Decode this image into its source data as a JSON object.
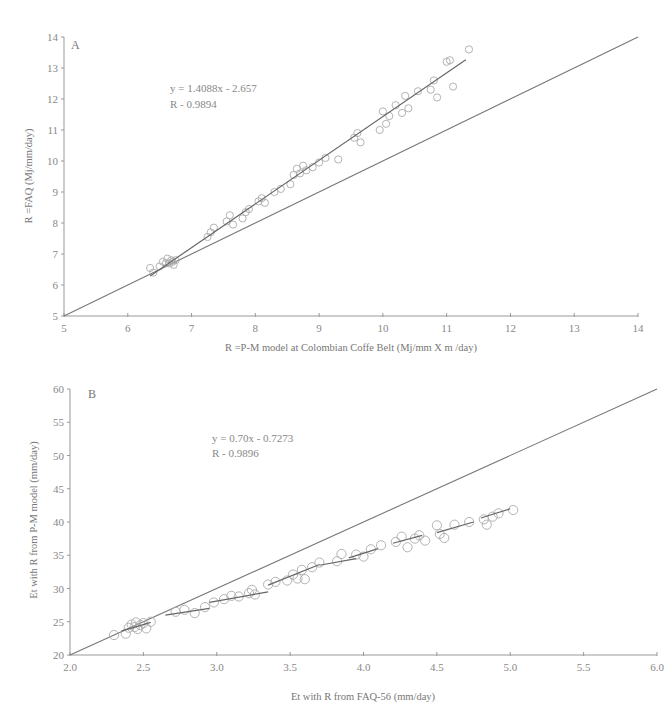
{
  "chart_data": [
    {
      "type": "scatter",
      "panel": "A",
      "title": "",
      "xlabel": "R =P-M model at Colombian Coffe Belt (Mj/mm X m /day)",
      "ylabel": "R =FAQ (Mj/mm/day)",
      "xlim": [
        5,
        14
      ],
      "ylim": [
        5,
        14
      ],
      "x_ticks": [
        "5",
        "6",
        "7",
        "8",
        "9",
        "10",
        "11",
        "12",
        "13",
        "14"
      ],
      "y_ticks": [
        "5",
        "6",
        "7",
        "8",
        "9",
        "10",
        "11",
        "12",
        "13",
        "14"
      ],
      "annotation": {
        "equation": "y = 1.4088x - 2.657",
        "r2": "R  - 0.9894"
      },
      "reference_line": {
        "name": "1:1",
        "from": [
          5,
          5
        ],
        "to": [
          14,
          14
        ]
      },
      "regression": {
        "slope": 1.4088,
        "intercept": -2.657,
        "x_range": [
          6.35,
          11.3
        ]
      },
      "grid": false,
      "legend": "none",
      "series": [
        {
          "name": "observations",
          "points": [
            [
              6.35,
              6.55
            ],
            [
              6.4,
              6.4
            ],
            [
              6.5,
              6.6
            ],
            [
              6.55,
              6.75
            ],
            [
              6.6,
              6.7
            ],
            [
              6.62,
              6.85
            ],
            [
              6.65,
              6.7
            ],
            [
              6.68,
              6.8
            ],
            [
              6.7,
              6.75
            ],
            [
              6.72,
              6.65
            ],
            [
              6.75,
              6.8
            ],
            [
              7.25,
              7.55
            ],
            [
              7.3,
              7.7
            ],
            [
              7.35,
              7.85
            ],
            [
              7.55,
              8.05
            ],
            [
              7.6,
              8.25
            ],
            [
              7.65,
              7.95
            ],
            [
              7.8,
              8.15
            ],
            [
              7.85,
              8.35
            ],
            [
              7.9,
              8.45
            ],
            [
              8.05,
              8.7
            ],
            [
              8.1,
              8.8
            ],
            [
              8.15,
              8.65
            ],
            [
              8.3,
              9.0
            ],
            [
              8.4,
              9.1
            ],
            [
              8.55,
              9.25
            ],
            [
              8.6,
              9.55
            ],
            [
              8.65,
              9.75
            ],
            [
              8.7,
              9.6
            ],
            [
              8.75,
              9.85
            ],
            [
              8.8,
              9.7
            ],
            [
              8.9,
              9.8
            ],
            [
              9.0,
              9.95
            ],
            [
              9.1,
              10.1
            ],
            [
              9.3,
              10.05
            ],
            [
              9.55,
              10.75
            ],
            [
              9.6,
              10.9
            ],
            [
              9.65,
              10.6
            ],
            [
              9.95,
              11.0
            ],
            [
              10.0,
              11.6
            ],
            [
              10.05,
              11.2
            ],
            [
              10.1,
              11.45
            ],
            [
              10.2,
              11.8
            ],
            [
              10.3,
              11.55
            ],
            [
              10.35,
              12.1
            ],
            [
              10.4,
              11.7
            ],
            [
              10.55,
              12.25
            ],
            [
              10.75,
              12.3
            ],
            [
              10.8,
              12.6
            ],
            [
              10.85,
              12.05
            ],
            [
              11.0,
              13.2
            ],
            [
              11.05,
              13.25
            ],
            [
              11.1,
              12.4
            ],
            [
              11.35,
              13.6
            ]
          ]
        }
      ]
    },
    {
      "type": "scatter",
      "panel": "B",
      "title": "",
      "xlabel": "Et with R from FAQ-56 (mm/day)",
      "ylabel": "Et with R from P-M model (mm/day)",
      "xlim": [
        2.0,
        6.0
      ],
      "ylim": [
        20,
        60
      ],
      "x_ticks": [
        "2.0",
        "2.5",
        "3.0",
        "3.5",
        "4.0",
        "4.5",
        "5.0",
        "5.5",
        "6.0"
      ],
      "y_ticks": [
        "20",
        "25",
        "30",
        "35",
        "40",
        "45",
        "50",
        "55",
        "60"
      ],
      "annotation": {
        "equation": "y = 0.70x - 0.7273",
        "r2": "R  - 0.9896"
      },
      "reference_line": {
        "name": "1:1",
        "from": [
          2.0,
          20
        ],
        "to": [
          6.0,
          60
        ]
      },
      "regression_segments": [
        {
          "from": [
            2.35,
            23.6
          ],
          "to": [
            2.55,
            24.9
          ]
        },
        {
          "from": [
            2.65,
            26.0
          ],
          "to": [
            2.95,
            27.0
          ]
        },
        {
          "from": [
            2.95,
            27.9
          ],
          "to": [
            3.35,
            29.5
          ]
        },
        {
          "from": [
            3.35,
            30.5
          ],
          "to": [
            3.7,
            33.6
          ]
        },
        {
          "from": [
            3.7,
            33.5
          ],
          "to": [
            3.95,
            34.5
          ]
        },
        {
          "from": [
            3.9,
            34.6
          ],
          "to": [
            4.1,
            36.0
          ]
        },
        {
          "from": [
            4.2,
            36.8
          ],
          "to": [
            4.4,
            38.0
          ]
        },
        {
          "from": [
            4.5,
            38.4
          ],
          "to": [
            4.75,
            40.0
          ]
        },
        {
          "from": [
            4.8,
            40.6
          ],
          "to": [
            5.0,
            42.0
          ]
        }
      ],
      "grid": false,
      "legend": "none",
      "series": [
        {
          "name": "observations",
          "points": [
            [
              2.3,
              23.0
            ],
            [
              2.38,
              23.2
            ],
            [
              2.4,
              24.1
            ],
            [
              2.42,
              24.6
            ],
            [
              2.44,
              24.2
            ],
            [
              2.45,
              24.9
            ],
            [
              2.46,
              23.9
            ],
            [
              2.48,
              24.5
            ],
            [
              2.5,
              24.8
            ],
            [
              2.52,
              24.0
            ],
            [
              2.55,
              25.0
            ],
            [
              2.72,
              26.5
            ],
            [
              2.78,
              26.8
            ],
            [
              2.85,
              26.3
            ],
            [
              2.92,
              27.2
            ],
            [
              2.98,
              27.9
            ],
            [
              3.05,
              28.4
            ],
            [
              3.1,
              28.9
            ],
            [
              3.15,
              28.8
            ],
            [
              3.22,
              29.3
            ],
            [
              3.24,
              29.8
            ],
            [
              3.26,
              29.1
            ],
            [
              3.35,
              30.6
            ],
            [
              3.4,
              31.0
            ],
            [
              3.48,
              31.2
            ],
            [
              3.52,
              32.1
            ],
            [
              3.55,
              31.5
            ],
            [
              3.58,
              32.8
            ],
            [
              3.6,
              31.4
            ],
            [
              3.65,
              33.2
            ],
            [
              3.7,
              33.9
            ],
            [
              3.82,
              34.1
            ],
            [
              3.85,
              35.2
            ],
            [
              3.95,
              35.1
            ],
            [
              4.0,
              34.8
            ],
            [
              4.05,
              35.9
            ],
            [
              4.12,
              36.5
            ],
            [
              4.22,
              37.0
            ],
            [
              4.26,
              37.8
            ],
            [
              4.3,
              36.2
            ],
            [
              4.35,
              37.5
            ],
            [
              4.38,
              38.0
            ],
            [
              4.42,
              37.2
            ],
            [
              4.5,
              39.5
            ],
            [
              4.52,
              38.2
            ],
            [
              4.55,
              37.6
            ],
            [
              4.62,
              39.6
            ],
            [
              4.72,
              40.0
            ],
            [
              4.82,
              40.4
            ],
            [
              4.84,
              39.6
            ],
            [
              4.88,
              40.8
            ],
            [
              4.92,
              41.3
            ],
            [
              5.02,
              41.8
            ]
          ]
        }
      ]
    }
  ]
}
